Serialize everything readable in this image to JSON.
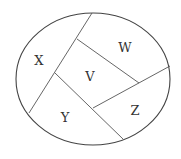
{
  "diagram": {
    "type": "region-partition",
    "shape": "ellipse",
    "regions": [
      {
        "id": "X",
        "label": "X"
      },
      {
        "id": "W",
        "label": "W"
      },
      {
        "id": "V",
        "label": "V"
      },
      {
        "id": "Y",
        "label": "Y"
      },
      {
        "id": "Z",
        "label": "Z"
      }
    ],
    "colors": {
      "outline": "#444444",
      "divider": "#555555",
      "label": "#333333",
      "background": "#ffffff"
    }
  }
}
